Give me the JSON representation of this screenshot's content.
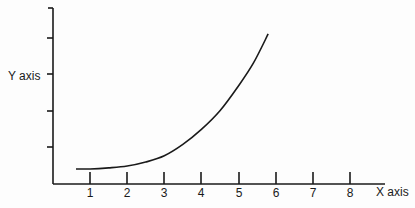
{
  "chart_data": {
    "type": "line",
    "title": "",
    "xlabel": "X axis",
    "ylabel": "Y axis",
    "x_ticks": [
      "1",
      "2",
      "3",
      "4",
      "5",
      "6",
      "7",
      "8"
    ],
    "y_ticks_count": 4,
    "y_tick_labels": [],
    "xlim": [
      0,
      9
    ],
    "ylim": [
      0,
      4.8
    ],
    "grid": false,
    "legend": null,
    "series": [
      {
        "name": "curve",
        "x": [
          0.62,
          1,
          1.5,
          2,
          2.5,
          3,
          3.5,
          4,
          4.5,
          5,
          5.4,
          5.8
        ],
        "y": [
          0.41,
          0.41,
          0.44,
          0.49,
          0.6,
          0.77,
          1.08,
          1.49,
          2.0,
          2.68,
          3.3,
          4.1
        ]
      }
    ]
  },
  "colors": {
    "line": "#1a1a1a",
    "background": "#fdfdfd"
  }
}
